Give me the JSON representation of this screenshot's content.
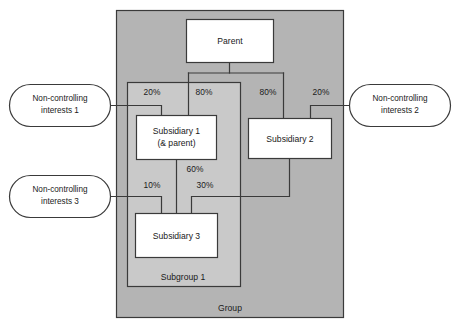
{
  "diagram": {
    "colors": {
      "group_fill": "#b4b4b4",
      "subgroup_fill": "#c9c9c9",
      "box_fill": "#ffffff",
      "stroke": "#3a3a3a",
      "text": "#1a1a1a",
      "page_background": "#ffffff"
    },
    "zones": [
      {
        "id": "group",
        "label": "Group"
      },
      {
        "id": "subgroup1",
        "label": "Subgroup 1"
      }
    ],
    "entities": [
      {
        "id": "parent",
        "label": "Parent",
        "line2": ""
      },
      {
        "id": "subsidiary1",
        "label": "Subsidiary 1",
        "line2": "(& parent)"
      },
      {
        "id": "subsidiary2",
        "label": "Subsidiary 2",
        "line2": ""
      },
      {
        "id": "subsidiary3",
        "label": "Subsidiary 3",
        "line2": ""
      }
    ],
    "callouts": [
      {
        "id": "nci1",
        "line1": "Non-controlling",
        "line2": "interests 1"
      },
      {
        "id": "nci2",
        "line1": "Non-controlling",
        "line2": "interests 2"
      },
      {
        "id": "nci3",
        "line1": "Non-controlling",
        "line2": "interests 3"
      }
    ],
    "ownership": [
      {
        "id": "nci1-sub1",
        "label": "20%",
        "from": "nci1",
        "to": "subsidiary1"
      },
      {
        "id": "parent-sub1",
        "label": "80%",
        "from": "parent",
        "to": "subsidiary1"
      },
      {
        "id": "parent-sub2",
        "label": "80%",
        "from": "parent",
        "to": "subsidiary2"
      },
      {
        "id": "nci2-sub2",
        "label": "20%",
        "from": "nci2",
        "to": "subsidiary2"
      },
      {
        "id": "sub1-sub3",
        "label": "60%",
        "from": "subsidiary1",
        "to": "subsidiary3"
      },
      {
        "id": "nci3-sub3",
        "label": "10%",
        "from": "nci3",
        "to": "subsidiary3"
      },
      {
        "id": "sub2-sub3",
        "label": "30%",
        "from": "subsidiary2",
        "to": "subsidiary3"
      }
    ]
  }
}
